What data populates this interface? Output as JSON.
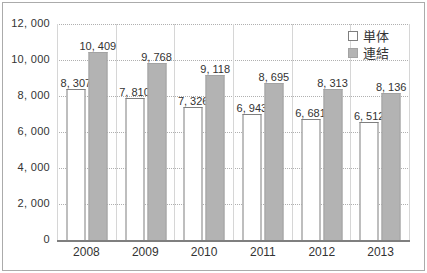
{
  "chart_data": {
    "type": "bar",
    "title": "",
    "xlabel": "",
    "ylabel": "",
    "categories": [
      "2008",
      "2009",
      "2010",
      "2011",
      "2012",
      "2013"
    ],
    "series": [
      {
        "name": "単体",
        "values": [
          8307,
          7810,
          7326,
          6943,
          6681,
          6512
        ],
        "labels": [
          "8, 307",
          "7, 810",
          "7, 326",
          "6, 943",
          "6, 681",
          "6, 512"
        ],
        "fill": "#ffffff",
        "border": "#7f7f7f"
      },
      {
        "name": "連結",
        "values": [
          10409,
          9768,
          9118,
          8695,
          8313,
          8136
        ],
        "labels": [
          "10, 409",
          "9, 768",
          "9, 118",
          "8, 695",
          "8, 313",
          "8, 136"
        ],
        "fill": "#b3b3b3",
        "border": "#a3a3a3"
      }
    ],
    "ylim": [
      0,
      12000
    ],
    "yticks": [
      {
        "value": 12000,
        "label": "12, 000"
      },
      {
        "value": 10000,
        "label": "10, 000"
      },
      {
        "value": 8000,
        "label": "8, 000"
      },
      {
        "value": 6000,
        "label": "6, 000"
      },
      {
        "value": 4000,
        "label": "4, 000"
      },
      {
        "value": 2000,
        "label": "2, 000"
      },
      {
        "value": 0,
        "label": "0"
      }
    ],
    "grid": "horizontal-dotted, vertical-category-boundaries",
    "legend_position": "top-right",
    "colors": {
      "frame_border": "#ababab",
      "axis_line": "#7f7f7f",
      "gridline": "#b0b0b0",
      "category_gridline": "#d6d6d6",
      "text": "#333333"
    }
  }
}
